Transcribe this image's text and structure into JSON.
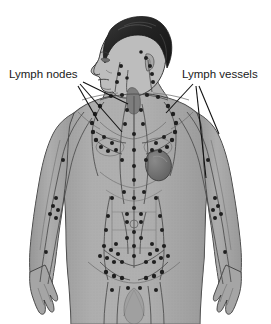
{
  "figure": {
    "background_color": "#ffffff",
    "style": "grayscale medical line illustration with halftone shading"
  },
  "labels": [
    {
      "id": "lymph-nodes",
      "text": "Lymph nodes",
      "x": 9,
      "y": 78,
      "anchor": "start",
      "color": "#1a1a1a",
      "leader_lines": [
        {
          "from": [
            83,
            82
          ],
          "to": [
            128,
            104
          ]
        },
        {
          "from": [
            80,
            84
          ],
          "to": [
            120,
            131
          ]
        },
        {
          "from": [
            78,
            86
          ],
          "to": [
            98,
            120
          ]
        }
      ]
    },
    {
      "id": "lymph-vessels",
      "text": "Lymph vessels",
      "x": 182,
      "y": 78,
      "anchor": "start",
      "color": "#1a1a1a",
      "leader_lines": [
        {
          "from": [
            193,
            84
          ],
          "to": [
            166,
            113
          ]
        },
        {
          "from": [
            196,
            86
          ],
          "to": [
            206,
            176
          ]
        },
        {
          "from": [
            199,
            86
          ],
          "to": [
            218,
            133
          ]
        }
      ]
    }
  ],
  "anatomy": {
    "colors": {
      "skin_fill": "#a9a9a9",
      "skin_shadow": "#8e8e8e",
      "skin_highlight": "#c2c2c2",
      "outline": "#3c3c3c",
      "hair": "#2b2b2b",
      "hair_highlight": "#5a5a5a",
      "node_fill": "#1f1f1f",
      "vessel_line": "#4a4a4a",
      "spleen": "#6f6f6f",
      "thymus": "#7b7b7b"
    },
    "regions": [
      {
        "name": "head",
        "description": "profile facing viewer's left with dark side-parted hair"
      },
      {
        "name": "neck",
        "description": "cervical lymph node chains along jaw and neck"
      },
      {
        "name": "chest",
        "description": "thoracic duct, clavicular and axillary node groups"
      },
      {
        "name": "abdomen",
        "description": "para-aortic and mesenteric node clusters around navel"
      },
      {
        "name": "pelvis",
        "description": "iliac and inguinal node clusters"
      },
      {
        "name": "arms",
        "description": "vessels running the length of both arms with cubital nodes at elbows"
      },
      {
        "name": "thighs",
        "description": "upper thighs cropped at image bottom edge"
      }
    ],
    "organs": [
      {
        "name": "spleen",
        "side": "viewer-right",
        "x": 155,
        "y": 160
      },
      {
        "name": "thymus",
        "side": "center",
        "x": 134,
        "y": 96
      }
    ],
    "node_count_visible": 120
  }
}
